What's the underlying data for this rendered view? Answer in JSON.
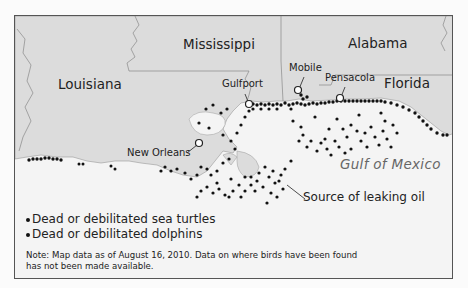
{
  "map": {
    "title": "Gulf oil spill wildlife map",
    "states": [
      {
        "name": "Louisiana"
      },
      {
        "name": "Mississippi"
      },
      {
        "name": "Alabama"
      },
      {
        "name": "Florida"
      }
    ],
    "cities": [
      {
        "name": "New Orleans"
      },
      {
        "name": "Gulfport"
      },
      {
        "name": "Mobile"
      },
      {
        "name": "Pensacola"
      }
    ],
    "water_label": "Gulf of Mexico",
    "annotation": "Source of leaking oil",
    "colors": {
      "land": "#dcdcdc",
      "water": "#f4f4f4",
      "border": "#555555",
      "markers": "#111111",
      "city_marker_fill": "#ffffff",
      "gulf_label": "#666666"
    }
  },
  "legend": {
    "items": [
      {
        "label": "Dead or debilitated sea turtles",
        "icon": "dot-marker"
      },
      {
        "label": "Dead or debilitated dolphins",
        "icon": "dot-marker"
      }
    ]
  },
  "note": "Note: Map data as of August 16, 2010. Data on where birds have been found has not been made available."
}
